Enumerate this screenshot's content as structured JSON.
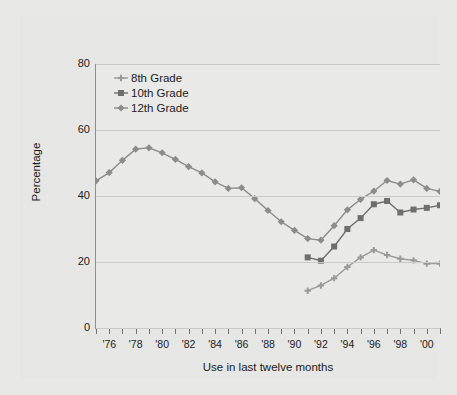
{
  "chart_data": {
    "type": "line",
    "title": "",
    "xlabel": "Use in last twelve months",
    "ylabel": "Percentage",
    "ylim": [
      0,
      80
    ],
    "yticks": [
      0,
      20,
      40,
      60,
      80
    ],
    "xlim": [
      1975,
      2001
    ],
    "xtick_years": [
      1975,
      1976,
      1977,
      1978,
      1979,
      1980,
      1981,
      1982,
      1983,
      1984,
      1985,
      1986,
      1987,
      1988,
      1989,
      1990,
      1991,
      1992,
      1993,
      1994,
      1995,
      1996,
      1997,
      1998,
      1999,
      2000,
      2001
    ],
    "xtick_labels": [
      {
        "year": 1976,
        "label": "'76"
      },
      {
        "year": 1978,
        "label": "'78"
      },
      {
        "year": 1980,
        "label": "'80"
      },
      {
        "year": 1982,
        "label": "'82"
      },
      {
        "year": 1984,
        "label": "'84"
      },
      {
        "year": 1986,
        "label": "'86"
      },
      {
        "year": 1988,
        "label": "'88"
      },
      {
        "year": 1990,
        "label": "'90"
      },
      {
        "year": 1992,
        "label": "'92"
      },
      {
        "year": 1994,
        "label": "'94"
      },
      {
        "year": 1996,
        "label": "'96"
      },
      {
        "year": 1998,
        "label": "'98"
      },
      {
        "year": 2000,
        "label": "'00"
      }
    ],
    "grid": "horizontal",
    "legend_position": "top-left",
    "series": [
      {
        "name": "8th Grade",
        "color": "#9a9a98",
        "marker": "cross",
        "x": [
          1991,
          1992,
          1993,
          1994,
          1995,
          1996,
          1997,
          1998,
          1999,
          2000,
          2001
        ],
        "values": [
          11.3,
          12.9,
          15.1,
          18.5,
          21.4,
          23.6,
          22.1,
          21.0,
          20.5,
          19.5,
          19.5
        ]
      },
      {
        "name": "10th Grade",
        "color": "#6e6e6c",
        "marker": "square",
        "x": [
          1991,
          1992,
          1993,
          1994,
          1995,
          1996,
          1997,
          1998,
          1999,
          2000,
          2001
        ],
        "values": [
          21.4,
          20.4,
          24.7,
          30.0,
          33.3,
          37.5,
          38.5,
          35.0,
          35.9,
          36.4,
          37.2
        ]
      },
      {
        "name": "12th Grade",
        "color": "#8c8c8a",
        "marker": "diamond",
        "x": [
          1975,
          1976,
          1977,
          1978,
          1979,
          1980,
          1981,
          1982,
          1983,
          1984,
          1985,
          1986,
          1987,
          1988,
          1989,
          1990,
          1991,
          1992,
          1993,
          1994,
          1995,
          1996,
          1997,
          1998,
          1999,
          2000,
          2001
        ],
        "values": [
          44.6,
          47.1,
          50.8,
          54.2,
          54.6,
          53.1,
          51.1,
          48.9,
          47.0,
          44.3,
          42.3,
          42.5,
          39.2,
          35.6,
          32.2,
          29.6,
          27.1,
          26.6,
          31.0,
          35.8,
          39.0,
          41.5,
          44.7,
          43.6,
          44.9,
          42.3,
          41.4
        ]
      }
    ]
  },
  "legend": {
    "items": [
      {
        "label": "8th Grade"
      },
      {
        "label": "10th Grade"
      },
      {
        "label": "12th Grade"
      }
    ]
  },
  "colors": {
    "page_background": "#e8e8e6",
    "plot_background": "#e9e9e7",
    "gridline": "#c9c9c7",
    "axis": "#8e8e8c",
    "text": "#1c1c1c"
  }
}
